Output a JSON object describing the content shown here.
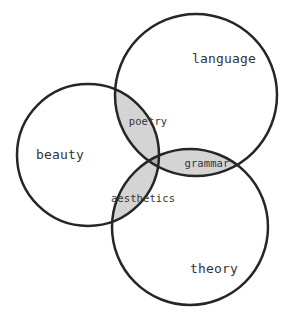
{
  "diagram": {
    "type": "venn-3-set",
    "title": "",
    "background_color": "#ffffff",
    "stroke_color": "#262626",
    "stroke_width": 2.5,
    "pair_fill_color": "#d4d4d4",
    "triple_fill_color": "#b0b0b0",
    "label_color": "#333333",
    "sets": [
      {
        "id": "beauty",
        "label": "beauty",
        "cx": 88,
        "cy": 155,
        "r": 71,
        "label_x": 60,
        "label_y": 155
      },
      {
        "id": "language",
        "label": "language",
        "cx": 196,
        "cy": 95,
        "r": 81,
        "label_x": 224,
        "label_y": 59
      },
      {
        "id": "theory",
        "label": "theory",
        "cx": 190,
        "cy": 227,
        "r": 78,
        "label_x": 214,
        "label_y": 269
      }
    ],
    "intersections": [
      {
        "id": "poetry",
        "label": "poetry",
        "sets": [
          "beauty",
          "language"
        ],
        "fill": "#d4d4d4",
        "label_x": 148,
        "label_y": 122
      },
      {
        "id": "grammar",
        "label": "grammar",
        "sets": [
          "language",
          "theory"
        ],
        "fill": "#d4d4d4",
        "label_x": 207,
        "label_y": 164
      },
      {
        "id": "aesthetics",
        "label": "aesthetics",
        "sets": [
          "beauty",
          "theory"
        ],
        "fill": "#d4d4d4",
        "label_x": 143,
        "label_y": 199
      },
      {
        "id": "center",
        "label": "",
        "sets": [
          "beauty",
          "language",
          "theory"
        ],
        "fill": "#b0b0b0",
        "label_x": 160,
        "label_y": 160
      }
    ]
  }
}
